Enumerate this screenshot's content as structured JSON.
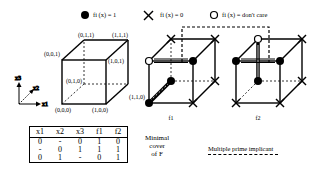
{
  "legend": {
    "on": {
      "icon": "filled-circle-icon",
      "label": "fi (x) = 1"
    },
    "off": {
      "icon": "x-cross-icon",
      "label": "fi (x) = 0"
    },
    "dc": {
      "icon": "hollow-circle-icon",
      "label": "fi (x) = don't care"
    }
  },
  "reference_cube": {
    "vertices": {
      "v000": "(0,0,0)",
      "v100": "(1,0,0)",
      "v001": "(0,0,1)",
      "v101": "(1,0,1)",
      "v010": "(0,1,0)",
      "v110": "(1,1,0)",
      "v011": "(0,1,1)",
      "v111": "(1,1,1)"
    },
    "axes": {
      "x1": "x1",
      "x2": "x2",
      "x3": "x3"
    }
  },
  "cubes": {
    "f1": {
      "label": "f1"
    },
    "f2": {
      "label": "f2"
    }
  },
  "table": {
    "headers": [
      "x1",
      "x2",
      "x3",
      "f1",
      "f2"
    ],
    "rows": [
      [
        "0",
        "-",
        "0",
        "1",
        "0"
      ],
      [
        "-",
        "0",
        "1",
        "1",
        "1"
      ],
      [
        "0",
        "1",
        "-",
        "0",
        "1"
      ]
    ],
    "caption_lines": [
      "Minimal",
      "cover",
      "of F"
    ]
  },
  "multiple_prime_implicant": {
    "label": "Multiple prime implicant"
  }
}
